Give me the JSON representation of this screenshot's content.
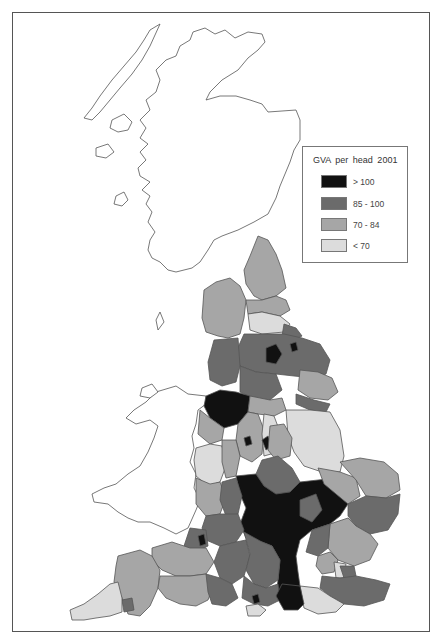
{
  "map": {
    "title": "GVA per head 2001",
    "subject": "Great Britain regional GVA per head choropleth (England sub-regions shaded, Scotland and Wales outline only)"
  },
  "legend": {
    "title": "GVA  per head 2001",
    "items": [
      {
        "label": "> 100",
        "color": "#111111"
      },
      {
        "label": "85 - 100",
        "color": "#6b6b6b"
      },
      {
        "label": "70 - 84",
        "color": "#a6a6a6"
      },
      {
        "label": "< 70",
        "color": "#dcdcdc"
      }
    ]
  },
  "colors": {
    "outline": "#555555",
    "frame": "#555555",
    "background": "#ffffff"
  }
}
